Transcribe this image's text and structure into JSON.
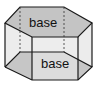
{
  "diagram": {
    "type": "hexagonal-prism",
    "labels": {
      "top_base": "base",
      "bottom_base": "base"
    },
    "colors": {
      "base_fill": "#c4c4c4",
      "side_fill": "#ebebeb",
      "edge": "#1a1a1a",
      "background": "#ffffff"
    }
  }
}
